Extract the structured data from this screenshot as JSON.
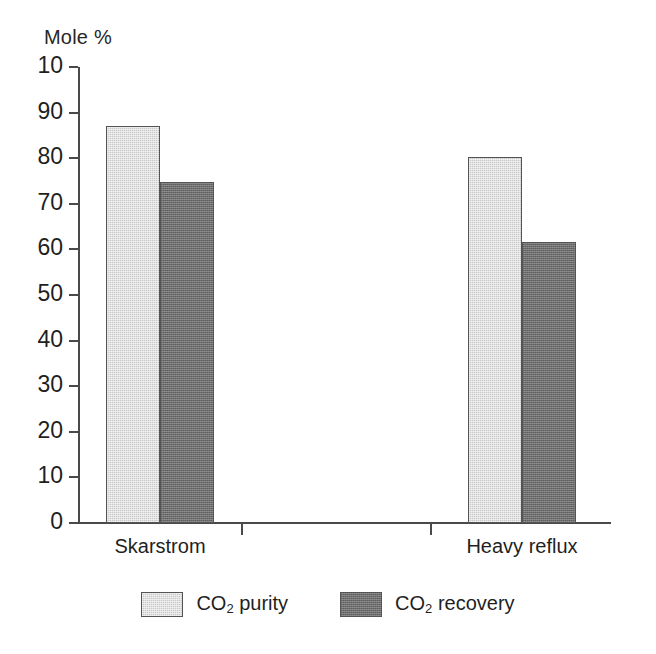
{
  "chart_data": {
    "type": "bar",
    "title": "",
    "xlabel": "",
    "ylabel": "Mole %",
    "categories": [
      "Skarstrom",
      "Heavy reflux"
    ],
    "series": [
      {
        "name": "CO2 purity",
        "label_prefix": "CO",
        "label_sub": "2",
        "label_suffix": " purity",
        "color": "#c9c9c9",
        "values": [
          87.0,
          80.3
        ]
      },
      {
        "name": "CO2 recovery",
        "label_prefix": "CO",
        "label_sub": "2",
        "label_suffix": " recovery",
        "color": "#6e6e6e",
        "values": [
          74.8,
          61.6
        ]
      }
    ],
    "ylim": [
      0,
      100
    ],
    "ytick_values": [
      100,
      90,
      80,
      70,
      60,
      50,
      40,
      30,
      20,
      10,
      0
    ],
    "ytick_labels": [
      "10",
      "90",
      "80",
      "70",
      "60",
      "50",
      "40",
      "30",
      "20",
      "10",
      "0"
    ],
    "grid": false,
    "legend_position": "bottom",
    "axis_color": "#4a4a4a",
    "bar_border_color": "#545454"
  },
  "axis": {
    "y_title": "Mole %"
  },
  "legend": {
    "items": [
      {
        "prefix": "CO",
        "sub": "2",
        "suffix": " purity"
      },
      {
        "prefix": "CO",
        "sub": "2",
        "suffix": " recovery"
      }
    ]
  }
}
